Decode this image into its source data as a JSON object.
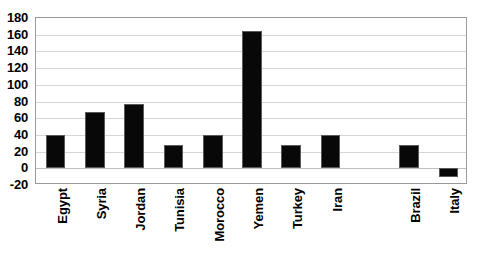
{
  "chart_data": {
    "type": "bar",
    "title": "",
    "subtitle": "",
    "xlabel": "",
    "ylabel": "",
    "categories": [
      "Egypt",
      "Syria",
      "Jordan",
      "Tunisia",
      "Morocco",
      "Yemen",
      "Turkey",
      "Iran",
      "",
      "Brazil",
      "Italy"
    ],
    "values": [
      40,
      68,
      77,
      28,
      40,
      165,
      28,
      40,
      null,
      28,
      -10
    ],
    "ylim": [
      -20,
      180
    ],
    "ytick_step": 20,
    "ytick_labels": [
      "180",
      "160",
      "140",
      "120",
      "100",
      "80",
      "60",
      "40",
      "20",
      "0",
      "-20"
    ],
    "ytick_values": [
      180,
      160,
      140,
      120,
      100,
      80,
      60,
      40,
      20,
      0,
      -20
    ],
    "grid": true,
    "grid_axis": "y",
    "legend": false,
    "legend_position": "none",
    "bar_color": "#080808",
    "bar_edge_color": "#5a5a5a",
    "grid_color": "#d6d6d6",
    "frame_color": "#9a9a9a",
    "background_color": "#ffffff",
    "text_color": "#000000",
    "xlabel_rotation": -90
  }
}
